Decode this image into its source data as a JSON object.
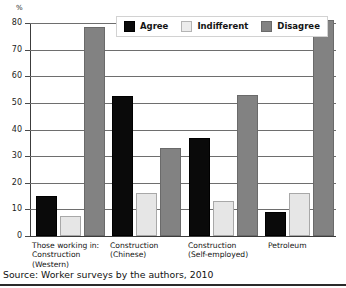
{
  "chart_data": {
    "type": "bar",
    "title": "",
    "subtitle": "",
    "xlabel": "",
    "ylabel": "%",
    "unit_label": "%",
    "ylim": [
      0,
      80
    ],
    "y_ticks": [
      0,
      10,
      20,
      30,
      40,
      50,
      60,
      70,
      80
    ],
    "y_tick_labels": [
      "0",
      "10",
      "20",
      "30",
      "40",
      "50",
      "60",
      "70",
      "80"
    ],
    "grid": true,
    "grid_axis": "y",
    "legend_position": "top-center",
    "categories": [
      "Those working in:\nConstruction\n(Western)",
      "Construction\n(Chinese)",
      "Construction\n(Self-employed)",
      "Petroleum"
    ],
    "series": [
      {
        "name": "Agree",
        "color": "#0a0a0a",
        "values": [
          15,
          52.5,
          37,
          9
        ]
      },
      {
        "name": "Indifferent",
        "color": "#e6e6e6",
        "values": [
          7.5,
          16,
          13,
          16
        ]
      },
      {
        "name": "Disagree",
        "color": "#828282",
        "values": [
          78.5,
          33,
          53,
          81
        ]
      }
    ]
  },
  "legend": {
    "entries": [
      {
        "label": "Agree"
      },
      {
        "label": "Indifferent"
      },
      {
        "label": "Disagree"
      }
    ]
  },
  "source": {
    "text": "Source: Worker surveys by the authors, 2010"
  }
}
